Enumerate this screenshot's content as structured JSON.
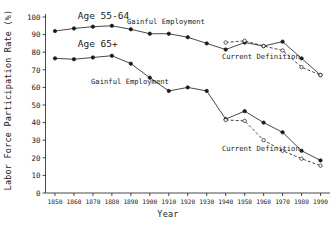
{
  "chart_data": {
    "type": "line",
    "title": "",
    "xlabel": "Year",
    "ylabel": "Labor Force Participation Rate (%)",
    "xlim": [
      1845,
      1995
    ],
    "ylim": [
      0,
      100
    ],
    "grid": false,
    "legend_position": "inline-annotations",
    "x_ticks": [
      1850,
      1860,
      1870,
      1880,
      1890,
      1900,
      1910,
      1920,
      1930,
      1940,
      1950,
      1960,
      1970,
      1980,
      1990
    ],
    "x_tick_labels": [
      "1850",
      "1860",
      "1870",
      "1880",
      "1890",
      "1900",
      "1910",
      "1920",
      "1930",
      "1940",
      "1950",
      "1960",
      "1970",
      "1980",
      "1990"
    ],
    "y_ticks": [
      0,
      10,
      20,
      30,
      40,
      50,
      60,
      70,
      80,
      90,
      100
    ],
    "y_tick_labels": [
      "0",
      "10",
      "20",
      "30",
      "40",
      "50",
      "60",
      "70",
      "80",
      "90",
      "100"
    ],
    "annotations": [
      {
        "text": "Age 55-64",
        "x": 1862,
        "y": 99,
        "size": "large"
      },
      {
        "text": "Age 65+",
        "x": 1862,
        "y": 83,
        "size": "large"
      },
      {
        "text": "Gainful Employment",
        "x": 1888,
        "y": 96,
        "size": "small"
      },
      {
        "text": "Current Definition",
        "x": 1938,
        "y": 76,
        "size": "small"
      },
      {
        "text": "Gainful Employment",
        "x": 1869,
        "y": 62,
        "size": "small"
      },
      {
        "text": "Current Definition",
        "x": 1938,
        "y": 24,
        "size": "small"
      }
    ],
    "series": [
      {
        "name": "Age 55-64 Gainful Employment",
        "group": "Age 55-64",
        "definition": "Gainful Employment",
        "style": "solid",
        "marker": "filled-circle",
        "color": "#1a1a1a",
        "x": [
          1850,
          1860,
          1870,
          1880,
          1890,
          1900,
          1910,
          1920,
          1930,
          1940,
          1950,
          1960,
          1970,
          1980,
          1990
        ],
        "values": [
          92.0,
          93.5,
          94.5,
          95.0,
          93.0,
          90.5,
          90.5,
          88.5,
          85.0,
          81.5,
          85.5,
          83.5,
          86.0,
          76.5,
          67.0
        ]
      },
      {
        "name": "Age 55-64 Current Definition",
        "group": "Age 55-64",
        "definition": "Current Definition",
        "style": "dashed",
        "marker": "open-circle",
        "color": "#1a1a1a",
        "x": [
          1940,
          1950,
          1960,
          1970,
          1980,
          1990
        ],
        "values": [
          85.5,
          86.5,
          83.5,
          81.0,
          71.5,
          67.0
        ]
      },
      {
        "name": "Age 65+ Gainful Employment",
        "group": "Age 65+",
        "definition": "Gainful Employment",
        "style": "solid",
        "marker": "filled-circle",
        "color": "#1a1a1a",
        "x": [
          1850,
          1860,
          1870,
          1880,
          1890,
          1900,
          1910,
          1920,
          1930,
          1940,
          1950,
          1960,
          1970,
          1980,
          1990
        ],
        "values": [
          76.5,
          76.0,
          77.0,
          78.0,
          73.5,
          65.5,
          58.0,
          60.0,
          58.0,
          42.0,
          46.5,
          40.0,
          34.5,
          24.0,
          18.5
        ]
      },
      {
        "name": "Age 65+ Current Definition",
        "group": "Age 65+",
        "definition": "Current Definition",
        "style": "dashed",
        "marker": "open-circle",
        "color": "#1a1a1a",
        "x": [
          1940,
          1950,
          1960,
          1970,
          1980,
          1990
        ],
        "values": [
          41.5,
          41.0,
          30.0,
          24.0,
          19.5,
          15.5
        ]
      }
    ]
  },
  "axes": {
    "y_title": "Labor Force Participation Rate (%)",
    "x_title": "Year"
  }
}
